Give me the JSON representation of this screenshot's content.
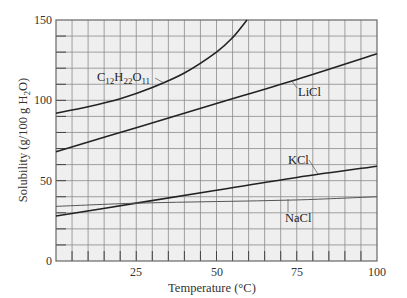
{
  "chart_data": {
    "type": "line",
    "title": "",
    "xlabel": "Temperature (°C)",
    "ylabel": "Solubility (g/100 g H2O)",
    "xlim": [
      0,
      100
    ],
    "ylim": [
      0,
      150
    ],
    "grid": true,
    "x_ticks": [
      0,
      25,
      50,
      75,
      100
    ],
    "x_tick_labels": [
      "25",
      "50",
      "75",
      "100"
    ],
    "y_ticks": [
      0,
      50,
      100,
      150
    ],
    "y_tick_labels": [
      "0",
      "50",
      "100",
      "150"
    ],
    "legend": "inline labels",
    "series": [
      {
        "name": "C12H22O11",
        "x": [
          0,
          10,
          20,
          30,
          40,
          50,
          55,
          59.5
        ],
        "values": [
          92,
          96,
          101,
          108,
          117,
          130,
          139,
          150
        ]
      },
      {
        "name": "LiCl",
        "x": [
          0,
          25,
          50,
          75,
          100
        ],
        "values": [
          68,
          83,
          98,
          113,
          129
        ]
      },
      {
        "name": "KCl",
        "x": [
          0,
          25,
          50,
          75,
          100
        ],
        "values": [
          28,
          36,
          44,
          52,
          59
        ]
      },
      {
        "name": "NaCl",
        "x": [
          0,
          25,
          50,
          75,
          100
        ],
        "values": [
          34,
          36,
          37,
          38,
          40
        ]
      }
    ]
  },
  "labels": {
    "sucrose": {
      "c": "C",
      "c_sub": "12",
      "h": "H",
      "h_sub": "22",
      "o": "O",
      "o_sub": "11"
    },
    "licl": "LiCl",
    "kcl": "KCl",
    "nacl": "NaCl",
    "ylabel_main": "Solubility (g/100 g H",
    "ylabel_sub": "2",
    "ylabel_end": "O)"
  }
}
